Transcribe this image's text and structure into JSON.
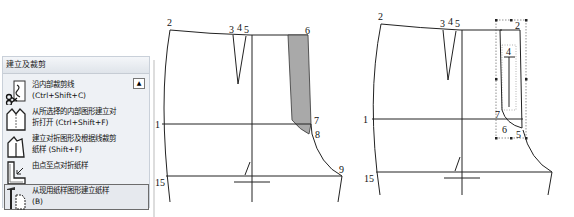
{
  "panel": {
    "title": "建立及裁剪",
    "scroll_up_icon": "triangle-up-icon",
    "items": [
      {
        "label": "沿内部裁剪线",
        "shortcut": "(Ctrl+Shift+C)",
        "icon": "cut-along-inner-line-icon"
      },
      {
        "label": "从所选择的内部图形建立对",
        "label2": "折打开 (Ctrl+Shift+F)",
        "icon": "fold-open-from-shape-icon"
      },
      {
        "label": "建立对折图形及根据线裁剪",
        "label2": "纸样 (Shift+F)",
        "icon": "fold-shape-cut-pattern-icon"
      },
      {
        "label": "由点至点对折纸样",
        "icon": "point-to-point-fold-icon"
      },
      {
        "label": "从现用纸样图形建立纸样",
        "shortcut": "(B)",
        "icon": "build-pattern-from-shape-icon",
        "selected": true
      }
    ]
  },
  "diagram_left": {
    "point_labels": [
      "2",
      "3",
      "4",
      "5",
      "6",
      "1",
      "7",
      "8",
      "15",
      "9"
    ],
    "shaded_fill": "#a9a9a9"
  },
  "diagram_right": {
    "point_labels": [
      "2",
      "3",
      "4",
      "5",
      "2",
      "4",
      "1",
      "7",
      "6",
      "5",
      "15"
    ]
  }
}
